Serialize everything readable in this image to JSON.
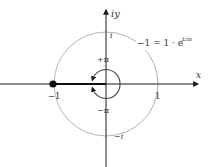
{
  "diagram": {
    "colors": {
      "axis": "#1a1a1a",
      "unit_circle": "#aaaaaa",
      "small_circle": "#444444",
      "segment": "#111111",
      "text": "#333333"
    },
    "axes": {
      "x_label": "x",
      "y_label": "iy"
    },
    "unit_circle_labels": {
      "top": "i",
      "bottom": "−i",
      "left": "−1",
      "right": "1"
    },
    "angle_labels": {
      "plus_pi": "+π",
      "minus_pi": "−π"
    },
    "equation": {
      "lhs": "−1 = 1 · e",
      "exponent": "±iπ"
    },
    "point": {
      "label": "−1",
      "description": "point at -1 on real axis"
    }
  }
}
